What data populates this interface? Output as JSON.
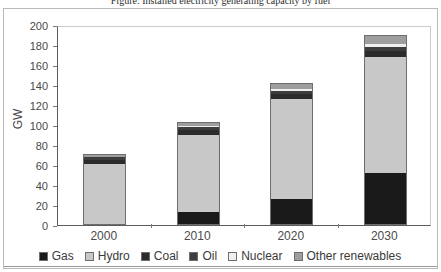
{
  "figure": {
    "title": "Figure: Installed electricity generating capacity by fuel",
    "frame_color": "#b9b9b9"
  },
  "chart_data": {
    "type": "bar",
    "subtype": "stacked",
    "title": "",
    "xlabel": "",
    "ylabel": "GW",
    "categories": [
      "2000",
      "2010",
      "2020",
      "2030"
    ],
    "ylim": [
      0,
      200
    ],
    "yticks": [
      0,
      20,
      40,
      60,
      80,
      100,
      120,
      140,
      160,
      180,
      200
    ],
    "ytick_labels": [
      "0",
      "20",
      "40",
      "60",
      "80",
      "100",
      "120",
      "140",
      "160",
      "180",
      "200"
    ],
    "grid": false,
    "legend_position": "bottom",
    "series": [
      {
        "name": "Gas",
        "color": "#1a1a1a",
        "values": [
          0,
          13,
          26,
          52
        ]
      },
      {
        "name": "Hydro",
        "color": "#c8c8c8",
        "values": [
          61,
          77,
          100,
          116
        ]
      },
      {
        "name": "Coal",
        "color": "#2b2b2b",
        "values": [
          4,
          5,
          5,
          6
        ]
      },
      {
        "name": "Oil",
        "color": "#3d3d3d",
        "values": [
          3,
          3,
          3,
          4
        ]
      },
      {
        "name": "Nuclear",
        "color": "#efefef",
        "values": [
          0,
          1,
          2,
          3
        ]
      },
      {
        "name": "Other renewables",
        "color": "#9e9e9e",
        "values": [
          3,
          4,
          6,
          9
        ]
      }
    ],
    "totals": [
      71,
      103,
      142,
      190
    ]
  },
  "legend": {
    "items": [
      {
        "label": "Gas",
        "color": "#1a1a1a"
      },
      {
        "label": "Hydro",
        "color": "#c8c8c8"
      },
      {
        "label": "Coal",
        "color": "#2b2b2b"
      },
      {
        "label": "Oil",
        "color": "#3d3d3d"
      },
      {
        "label": "Nuclear",
        "color": "#efefef"
      },
      {
        "label": "Other renewables",
        "color": "#9e9e9e"
      }
    ]
  }
}
